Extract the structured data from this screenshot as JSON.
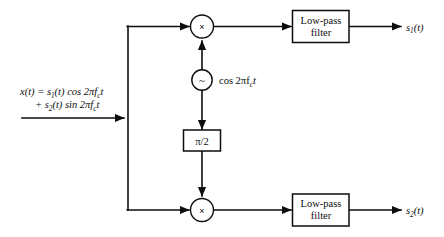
{
  "diagram": {
    "colors": {
      "background": "#ffffff",
      "line": "#0d0d0d",
      "fill": "#ffffff"
    },
    "input": {
      "name": "input-signal-label",
      "line1_lead": "x(t) = s",
      "line1_sub": "1",
      "line1_rest": "(t) cos 2πf",
      "line1_sub2": "c",
      "line1_tail": "t",
      "line2_lead": "+ s",
      "line2_sub": "2",
      "line2_rest": "(t) sin 2πf",
      "line2_sub2": "c",
      "line2_tail": "t",
      "plain_text": "x(t) = s1(t) cos 2πfc t + s2(t) sin 2πfc t"
    },
    "multipliers": [
      {
        "name": "multiplier-top",
        "symbol": "×"
      },
      {
        "name": "multiplier-bottom",
        "symbol": "×"
      }
    ],
    "oscillator": {
      "name": "local-oscillator",
      "symbol": "~",
      "label_lead": "cos 2πf",
      "label_sub": "c",
      "label_tail": "t",
      "plain_text": "cos 2πfc t"
    },
    "phase_shifter": {
      "name": "phase-shift-block",
      "label": "π/2"
    },
    "filters": [
      {
        "name": "low-pass-filter-top",
        "line1": "Low-pass",
        "line2": "filter"
      },
      {
        "name": "low-pass-filter-bottom",
        "line1": "Low-pass",
        "line2": "filter"
      }
    ],
    "outputs": [
      {
        "name": "output-s1",
        "lead": "s",
        "sub": "1",
        "tail": "(t)",
        "plain_text": "s1(t)"
      },
      {
        "name": "output-s2",
        "lead": "s",
        "sub": "2",
        "tail": "(t)",
        "plain_text": "s2(t)"
      }
    ]
  }
}
